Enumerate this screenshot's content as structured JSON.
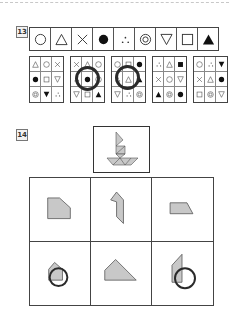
{
  "questions": [
    {
      "number": "13",
      "symbol_strip": [
        "circle",
        "triangle",
        "cross",
        "filled-circle",
        "three-dots",
        "double-circle",
        "down-triangle",
        "square",
        "filled-triangle"
      ],
      "options": [
        {
          "cells": [
            "triangle",
            "circle",
            "cross",
            "filled-circle",
            "square",
            "down-triangle",
            "double-circle",
            "filled-down-triangle",
            "three-dots"
          ],
          "circled": false
        },
        {
          "cells": [
            "cross",
            "triangle",
            "circle",
            "three-dots",
            "filled-circle",
            "circle",
            "down-triangle",
            "square",
            "filled-triangle"
          ],
          "circled": true
        },
        {
          "cells": [
            "circle",
            "square",
            "filled-circle",
            "three-dots",
            "triangle",
            "filled-triangle",
            "down-triangle",
            "three-dots",
            "double-circle"
          ],
          "circled": true
        },
        {
          "cells": [
            "three-dots",
            "triangle",
            "filled-square",
            "cross",
            "circle",
            "down-triangle",
            "filled-triangle",
            "double-circle",
            "filled-circle"
          ],
          "circled": false
        },
        {
          "cells": [
            "circle",
            "three-dots",
            "filled-down-triangle",
            "cross",
            "triangle",
            "filled-circle",
            "square",
            "double-circle",
            "down-triangle"
          ],
          "circled": false
        }
      ]
    },
    {
      "number": "14",
      "target_figure": "tangram-sailboat",
      "answers": [
        {
          "shape": "pentagon-cut-corner",
          "circled": false
        },
        {
          "shape": "bent-parallelogram",
          "circled": false
        },
        {
          "shape": "trapezoid",
          "circled": false
        },
        {
          "shape": "house-pentagon",
          "circled": true
        },
        {
          "shape": "right-trapezoid-triangle",
          "circled": false
        },
        {
          "shape": "tall-notched-quad",
          "circled": true
        }
      ]
    }
  ],
  "colors": {
    "shape_fill": "#c8c8c8",
    "shape_stroke": "#555555",
    "mark": "#2a2a2a"
  }
}
